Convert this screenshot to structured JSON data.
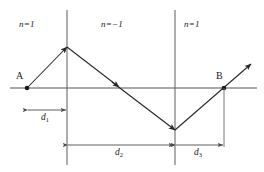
{
  "figure": {
    "colors": {
      "line": "#4d4d4d",
      "ray": "#262626",
      "text": "#1a1a1a",
      "background": "#ffffff"
    },
    "regions": [
      {
        "id": "region-left",
        "label": "n=1",
        "index_value": 1
      },
      {
        "id": "region-middle",
        "label": "n=−1",
        "index_value": -1
      },
      {
        "id": "region-right",
        "label": "n=1",
        "index_value": 1
      }
    ],
    "points": [
      {
        "id": "point-a",
        "label": "A",
        "x": 27,
        "y": 88
      },
      {
        "id": "point-b",
        "label": "B",
        "x": 224,
        "y": 88
      }
    ],
    "dimensions": [
      {
        "id": "dim-d1",
        "symbol": "d",
        "subscript": "1",
        "from_x": 27,
        "to_x": 67,
        "y": 110
      },
      {
        "id": "dim-d2",
        "symbol": "d",
        "subscript": "2",
        "from_x": 67,
        "to_x": 175,
        "y": 145
      },
      {
        "id": "dim-d3",
        "symbol": "d",
        "subscript": "3",
        "from_x": 175,
        "to_x": 224,
        "y": 145
      }
    ],
    "axis": {
      "y": 88,
      "x_start": 10,
      "x_end": 257
    },
    "boundaries": [
      {
        "id": "boundary-left",
        "x": 67,
        "y_top": 10,
        "y_bottom": 165
      },
      {
        "id": "boundary-right",
        "x": 175,
        "y_top": 10,
        "y_bottom": 165
      }
    ],
    "ray_path": [
      {
        "x": 27,
        "y": 88
      },
      {
        "x": 67,
        "y": 47
      },
      {
        "x": 175,
        "y": 130
      },
      {
        "x": 224,
        "y": 88
      },
      {
        "x": 251,
        "y": 64
      }
    ]
  }
}
